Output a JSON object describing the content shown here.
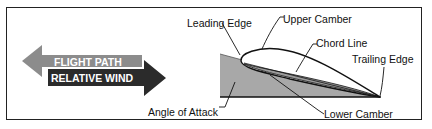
{
  "diagram": {
    "arrows": {
      "flight_path": {
        "label": "FLIGHT PATH",
        "direction": "left",
        "color": "#8c8c8c"
      },
      "relative_wind": {
        "label": "RELATIVE WIND",
        "direction": "right",
        "color": "#2b2b2b"
      }
    },
    "labels": {
      "leading_edge": "Leading Edge",
      "upper_camber": "Upper Camber",
      "chord_line": "Chord Line",
      "trailing_edge": "Trailing Edge",
      "angle_of_attack": "Angle of Attack",
      "lower_camber": "Lower Camber"
    },
    "colors": {
      "wedge_fill": "#a8a8a8",
      "frame": "#222222",
      "line": "#111111"
    }
  }
}
